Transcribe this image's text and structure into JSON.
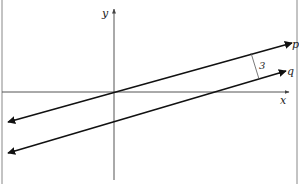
{
  "diagram": {
    "type": "coordinate-plane-parallel-lines",
    "axes": {
      "x_label": "x",
      "y_label": "y"
    },
    "lines": [
      {
        "label": "p",
        "from": [
          8,
          122
        ],
        "to": [
          292,
          43
        ]
      },
      {
        "label": "q",
        "from": [
          8,
          153
        ],
        "to": [
          286,
          71
        ]
      }
    ],
    "distance_marker": {
      "label": "3"
    },
    "colors": {
      "line": "#111111",
      "axis": "#555555",
      "frame": "#888888",
      "background": "#ffffff"
    }
  }
}
